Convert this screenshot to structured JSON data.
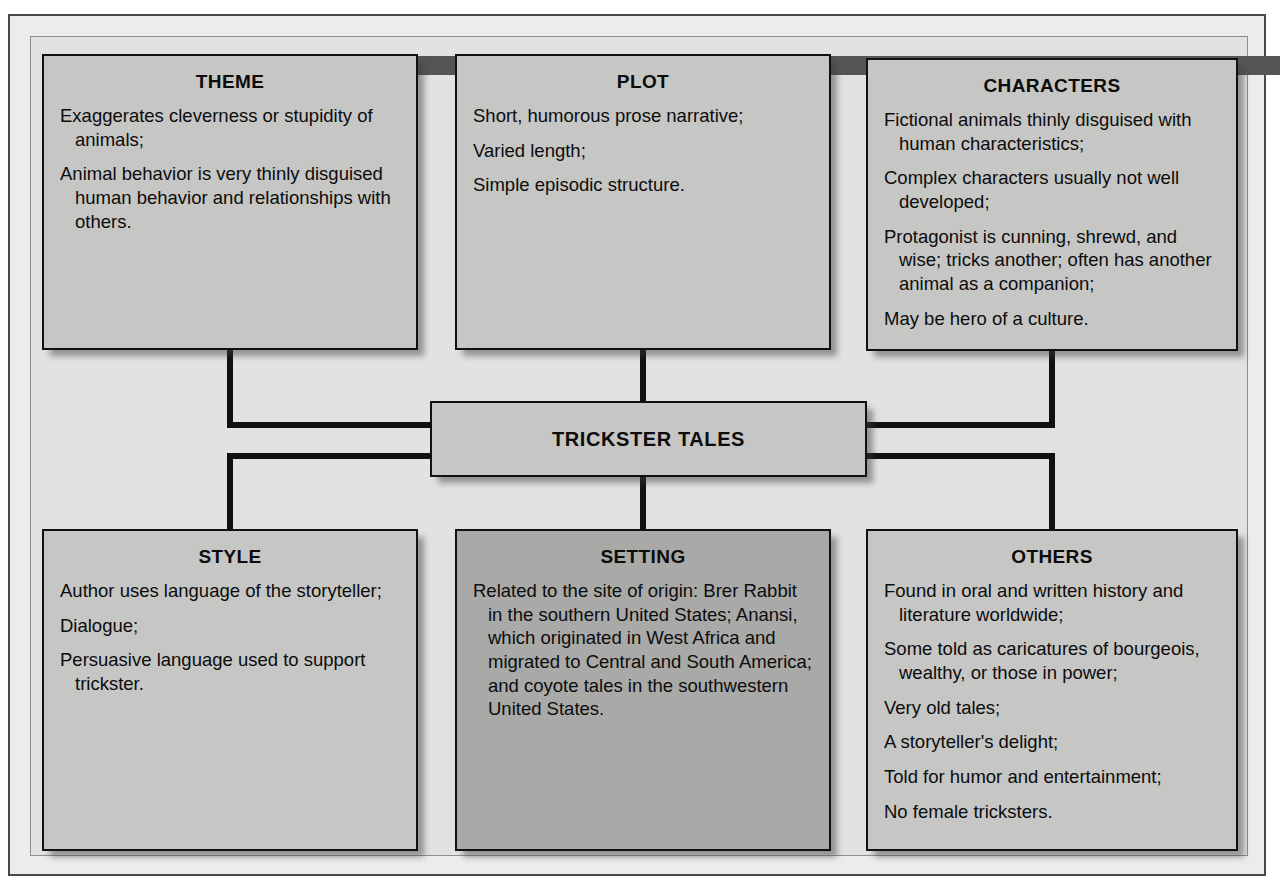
{
  "diagram": {
    "center": {
      "label": "TRICKSTER TALES"
    },
    "nodes": {
      "theme": {
        "title": "THEME",
        "lines": [
          "Exaggerates cleverness or stupidity of animals;",
          "Animal behavior is very thinly disguised human behavior and relationships with others."
        ]
      },
      "plot": {
        "title": "PLOT",
        "lines": [
          "Short, humorous prose narrative;",
          "Varied length;",
          "Simple episodic structure."
        ]
      },
      "characters": {
        "title": "CHARACTERS",
        "lines": [
          "Fictional animals thinly disguised with human characteristics;",
          "Complex characters usually not well developed;",
          "Protagonist is cunning, shrewd, and wise; tricks another; often has another animal as a companion;",
          "May be hero of a culture."
        ]
      },
      "style": {
        "title": "STYLE",
        "lines": [
          "Author uses language of the storyteller;",
          "Dialogue;",
          "Persuasive language used to support trickster."
        ]
      },
      "setting": {
        "title": "SETTING",
        "lines": [
          "Related to the site of origin: Brer Rabbit in the southern United States; Anansi, which originated in West Africa and migrated to Central and South America; and coyote tales in the southwestern United States."
        ]
      },
      "others": {
        "title": "OTHERS",
        "lines": [
          "Found in oral and written history and literature worldwide;",
          "Some told as caricatures of bourgeois, wealthy, or those in power;",
          "Very old tales;",
          "A storyteller's delight;",
          "Told for humor and entertainment;",
          "No female tricksters."
        ]
      }
    },
    "colors": {
      "box_fill": "#c6c6c5",
      "box_fill_dark": "#a9a9a8",
      "border": "#111111",
      "panel_background": "#e2e2e1",
      "top_bar": "#555556",
      "text": "#0c0c0c"
    }
  }
}
